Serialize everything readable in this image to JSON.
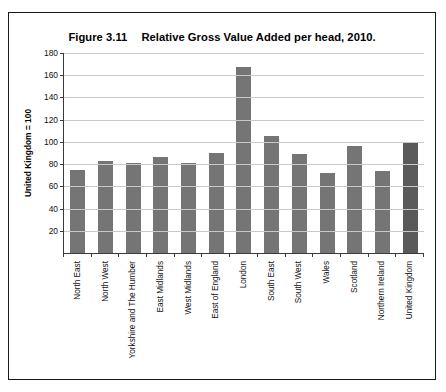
{
  "scan_artifact": {
    "top_running_text": ""
  },
  "figure": {
    "number": "Figure 3.11",
    "caption": "Relative Gross Value Added per head, 2010."
  },
  "chart_data": {
    "type": "bar",
    "title": "Relative Gross Value Added per head, 2010.",
    "xlabel": "",
    "ylabel": "United Kingdom = 100",
    "ylim": [
      0,
      180
    ],
    "yticks": [
      0,
      20,
      40,
      60,
      80,
      100,
      120,
      140,
      160,
      180
    ],
    "ytick_labels": [
      "",
      "20",
      "40",
      "60",
      "80",
      "100",
      "120",
      "140",
      "160",
      "180"
    ],
    "grid": true,
    "legend": "none",
    "categories": [
      "North East",
      "North West",
      "Yorkshire and The Humber",
      "East Midlands",
      "West Midlands",
      "East of England",
      "London",
      "South East",
      "South West",
      "Wales",
      "Scotland",
      "Northern Ireland",
      "United Kingdom"
    ],
    "values": [
      75,
      83,
      81,
      86,
      81,
      90,
      167,
      105,
      89,
      72,
      96,
      74,
      99
    ],
    "bar_color": "#757575",
    "highlight_color": "#5a5a5a",
    "highlight_index": 12
  }
}
